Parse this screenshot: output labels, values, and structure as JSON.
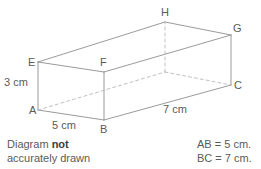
{
  "figure": {
    "type": "cuboid-diagram",
    "vertices": [
      {
        "label": "A",
        "x": 29,
        "y": 105
      },
      {
        "label": "B",
        "x": 100,
        "y": 124
      },
      {
        "label": "C",
        "x": 234,
        "y": 80
      },
      {
        "label": "E",
        "x": 28,
        "y": 57
      },
      {
        "label": "F",
        "x": 100,
        "y": 57
      },
      {
        "label": "G",
        "x": 233,
        "y": 23
      },
      {
        "label": "H",
        "x": 161,
        "y": 7
      }
    ],
    "dimensions": [
      {
        "label": "3 cm",
        "x": 4,
        "y": 77
      },
      {
        "label": "5 cm",
        "x": 52,
        "y": 120
      },
      {
        "label": "7 cm",
        "x": 163,
        "y": 104
      }
    ],
    "stroke_color": "#8e8e8e",
    "hidden_stroke_color": "#b9b9b9"
  },
  "note": {
    "line1_prefix": "Diagram ",
    "line1_bold": "not",
    "line2": "accurately drawn"
  },
  "given": {
    "line1": "AB = 5 cm.",
    "line2": "BC = 7 cm."
  }
}
